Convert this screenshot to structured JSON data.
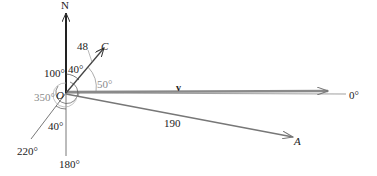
{
  "diagram": {
    "origin_label": "O",
    "north_label": "N",
    "points": {
      "C": {
        "label": "C",
        "magnitude_label": "48"
      },
      "A": {
        "label": "A",
        "magnitude_label": "190"
      },
      "v": {
        "label": "v"
      }
    },
    "angle_labels": {
      "a100": "100°",
      "a40_top": "40°",
      "a50": "50°",
      "a350": "350°",
      "a40_bottom": "40°",
      "a220": "220°",
      "a180": "180°",
      "a0": "0°"
    },
    "colors": {
      "dark_line": "#333333",
      "gray_line": "#8a8a8a",
      "text": "#222222"
    }
  }
}
